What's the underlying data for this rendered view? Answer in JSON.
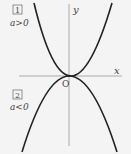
{
  "diagram": {
    "axes": {
      "x_label": "x",
      "y_label": "y",
      "origin_label": "O"
    },
    "cases": [
      {
        "number": "1",
        "condition": "a>0",
        "shape": "upward parabola"
      },
      {
        "number": "2",
        "condition": "a<0",
        "shape": "downward parabola"
      }
    ],
    "colors": {
      "background": "#f4f4f4",
      "curve": "#222222",
      "axis": "#aaaaaa",
      "text": "#444444"
    }
  }
}
